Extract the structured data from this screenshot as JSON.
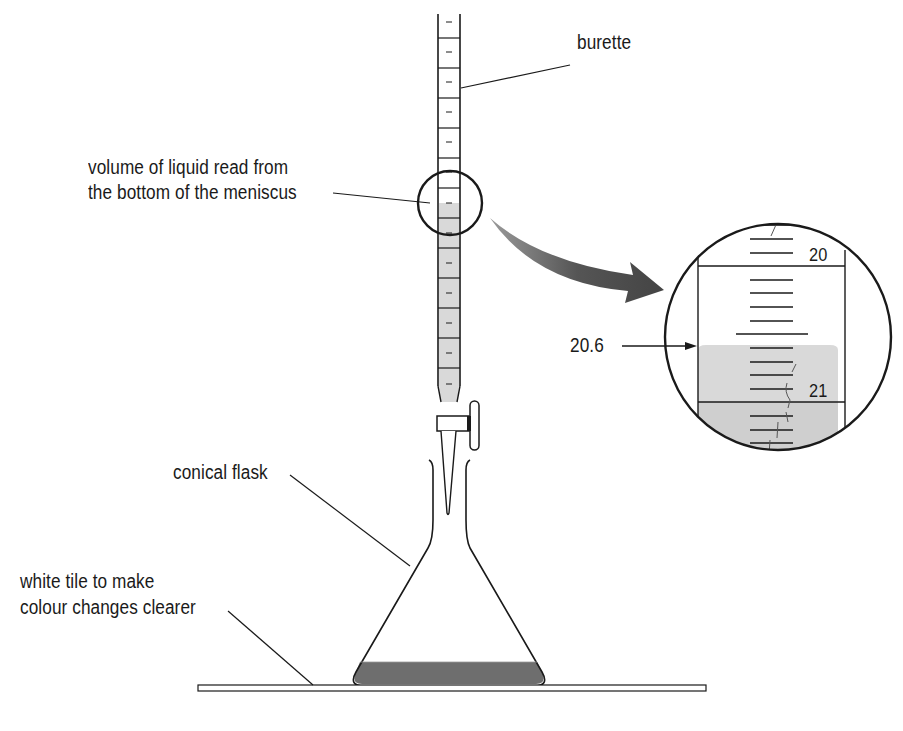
{
  "labels": {
    "burette": "burette",
    "meniscus_line1": "volume of liquid read from",
    "meniscus_line2": "the bottom of the meniscus",
    "reading_value": "20.6",
    "scale_20": "20",
    "scale_21": "21",
    "conical_flask": "conical flask",
    "tile_line1": "white tile to make",
    "tile_line2": "colour changes clearer"
  },
  "colors": {
    "line": "#1a1a1a",
    "liquid_light": "#d9d9d9",
    "liquid_dark": "#6e6e6e",
    "arrow": "#5a5a5a",
    "background": "#ffffff"
  }
}
